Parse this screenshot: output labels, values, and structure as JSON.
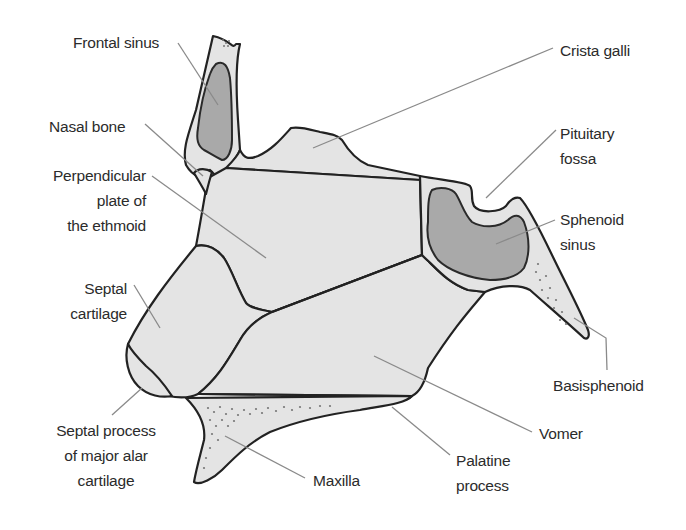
{
  "figure": {
    "colors": {
      "bone_fill": "#e4e4e4",
      "sinus_fill": "#a9a9a9",
      "outline": "#222222",
      "leader_line": "#8a8a8a",
      "text": "#2b2b2b"
    }
  },
  "labels": {
    "frontal_sinus": "Frontal sinus",
    "nasal_bone": "Nasal bone",
    "perpendicular_plate": "Perpendicular\nplate of\nthe ethmoid",
    "septal_cartilage": "Septal\ncartilage",
    "septal_process": "Septal process\nof major alar\ncartilage",
    "maxilla": "Maxilla",
    "palatine_process": "Palatine\nprocess",
    "vomer": "Vomer",
    "basisphenoid": "Basisphenoid",
    "sphenoid_sinus": "Sphenoid\nsinus",
    "pituitary_fossa": "Pituitary\nfossa",
    "crista_galli": "Crista galli"
  }
}
